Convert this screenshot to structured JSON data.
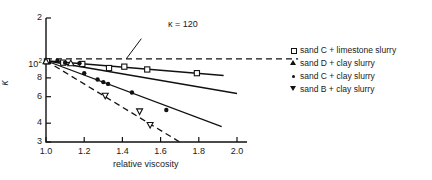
{
  "chart_data": {
    "type": "scatter",
    "title": "",
    "xlabel": "relative viscosity",
    "ylabel": "κ",
    "xlim": [
      1.0,
      2.0
    ],
    "ylim": [
      30,
      200
    ],
    "yscale": "log",
    "xscale": "linear",
    "grid": false,
    "legend_position": "right",
    "xticks": [
      {
        "value": 1.0,
        "label": "1.0"
      },
      {
        "value": 1.2,
        "label": "1.2"
      },
      {
        "value": 1.4,
        "label": "1.4"
      },
      {
        "value": 1.6,
        "label": "1.6"
      },
      {
        "value": 1.8,
        "label": "1.8"
      },
      {
        "value": 2.0,
        "label": "2.0"
      }
    ],
    "yticks": [
      {
        "value": 200,
        "label": "2",
        "sup": ""
      },
      {
        "value": 100,
        "label": "10",
        "sup": "2"
      },
      {
        "value": 80,
        "label": "8",
        "sup": ""
      },
      {
        "value": 60,
        "label": "6",
        "sup": ""
      },
      {
        "value": 40,
        "label": "4",
        "sup": ""
      },
      {
        "value": 30,
        "label": "3",
        "sup": ""
      }
    ],
    "annotations": [
      {
        "text": "κ = 120",
        "x": 1.52,
        "y": 155,
        "leader_to_x": 1.42,
        "leader_to_y": 107
      }
    ],
    "series": [
      {
        "name": "sand C + limestone slurry",
        "marker": "open-square",
        "line": "solid",
        "points": [
          {
            "x": 1.005,
            "y": 103
          },
          {
            "x": 1.09,
            "y": 101
          },
          {
            "x": 1.19,
            "y": 99
          },
          {
            "x": 1.33,
            "y": 93
          },
          {
            "x": 1.41,
            "y": 95
          },
          {
            "x": 1.53,
            "y": 91
          },
          {
            "x": 1.79,
            "y": 86
          }
        ],
        "fit_line": {
          "x1": 1.0,
          "y1": 104,
          "x2": 1.93,
          "y2": 83
        }
      },
      {
        "name": "sand D + clay slurry",
        "marker": "open-triangle-up",
        "line": "solid",
        "points": [
          {
            "x": 1.0,
            "y": 103
          },
          {
            "x": 1.13,
            "y": 100
          }
        ],
        "fit_line": {
          "x1": 1.0,
          "y1": 104,
          "x2": 2.0,
          "y2": 63
        }
      },
      {
        "name": "sand C + clay slurry",
        "marker": "filled-circle",
        "line": "solid",
        "points": [
          {
            "x": 1.06,
            "y": 104
          },
          {
            "x": 1.1,
            "y": 101
          },
          {
            "x": 1.175,
            "y": 100
          },
          {
            "x": 1.2,
            "y": 86
          },
          {
            "x": 1.27,
            "y": 78
          },
          {
            "x": 1.3,
            "y": 75
          },
          {
            "x": 1.325,
            "y": 73
          },
          {
            "x": 1.45,
            "y": 64
          },
          {
            "x": 1.63,
            "y": 49
          }
        ],
        "fit_line": {
          "x1": 1.0,
          "y1": 104,
          "x2": 1.92,
          "y2": 38
        }
      },
      {
        "name": "sand B + clay slurry",
        "marker": "open-triangle-down",
        "line": "dashed",
        "points": [
          {
            "x": 1.31,
            "y": 61
          },
          {
            "x": 1.49,
            "y": 48
          },
          {
            "x": 1.545,
            "y": 39
          }
        ],
        "fit_line": {
          "x1": 1.0,
          "y1": 104,
          "x2": 1.7,
          "y2": 30
        }
      }
    ],
    "reference_lines": [
      {
        "label": "κ = 120",
        "type": "horizontal-dashed",
        "y": 107,
        "x1": 1.0,
        "x2": 2.32
      }
    ]
  },
  "legend": {
    "entries": [
      {
        "marker": "open-square",
        "label": "sand C + limestone slurry"
      },
      {
        "marker": "open-triangle-up",
        "label": "sand D + clay slurry"
      },
      {
        "marker": "filled-circle",
        "label": "sand C + clay slurry"
      },
      {
        "marker": "open-triangle-down",
        "label": "sand B + clay slurry"
      }
    ]
  }
}
